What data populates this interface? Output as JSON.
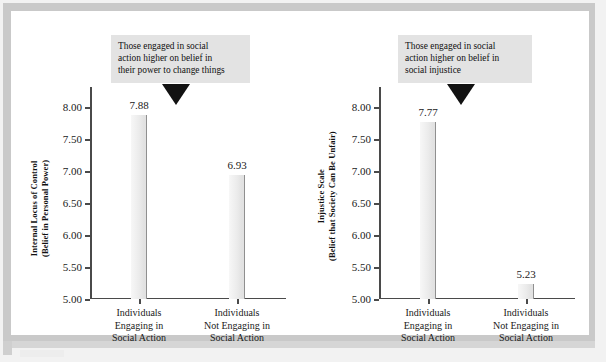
{
  "figure": {
    "background_color": "#ffffff",
    "frame_color": "#c9c9c9",
    "bar_fill_color": "#ebebeb",
    "bar_edge_color": "#8f8f8f",
    "callout_background_color": "#e3e3e3",
    "pointer_color": "#121212",
    "axis_color": "#4a4a4a"
  },
  "chart_data": [
    {
      "type": "bar",
      "title": "",
      "xlabel": "",
      "ylabel": "Internal Locus of Control (Belief in Personal Power)",
      "ylabel_line1": "Internal Locus of Control",
      "ylabel_line2": "(Belief in Personal Power)",
      "categories": [
        "Individuals Engaging in Social Action",
        "Individuals Not Engaging in Social Action"
      ],
      "category_lines": [
        [
          "Individuals",
          "Engaging in",
          "Social Action"
        ],
        [
          "Individuals",
          "Not Engaging in",
          "Social Action"
        ]
      ],
      "values": [
        7.88,
        6.93
      ],
      "value_labels": [
        "7.88",
        "6.93"
      ],
      "ylim": [
        5.0,
        8.0
      ],
      "yticks": [
        8.0,
        7.5,
        7.0,
        6.5,
        6.0,
        5.5,
        5.0
      ],
      "ytick_labels": [
        "8.00",
        "7.50",
        "7.00",
        "6.50",
        "6.00",
        "5.50",
        "5.00"
      ],
      "grid": false,
      "legend": "none",
      "annotation": {
        "lines": [
          "Those engaged in social",
          "action higher on belief in",
          "their power to change things"
        ],
        "points_to": "Individuals Engaging in Social Action"
      }
    },
    {
      "type": "bar",
      "title": "",
      "xlabel": "",
      "ylabel": "Injustice Scale (Belief that Society Can Be Unfair)",
      "ylabel_line1": "Injustice Scale",
      "ylabel_line2": "(Belief that Society Can Be Unfair)",
      "categories": [
        "Individuals Engaging in Social Action",
        "Individuals Not Engaging in Social Action"
      ],
      "category_lines": [
        [
          "Individuals",
          "Engaging in",
          "Social Action"
        ],
        [
          "Individuals",
          "Not Engaging in",
          "Social Action"
        ]
      ],
      "values": [
        7.77,
        5.23
      ],
      "value_labels": [
        "7.77",
        "5.23"
      ],
      "ylim": [
        5.0,
        8.0
      ],
      "yticks": [
        8.0,
        7.5,
        7.0,
        6.5,
        6.0,
        5.5,
        5.0
      ],
      "ytick_labels": [
        "8.00",
        "7.50",
        "7.00",
        "6.50",
        "6.00",
        "5.50",
        "5.00"
      ],
      "grid": false,
      "legend": "none",
      "annotation": {
        "lines": [
          "Those engaged in social",
          "action higher on belief in",
          "social injustice"
        ],
        "points_to": "Individuals Engaging in Social Action"
      }
    }
  ]
}
